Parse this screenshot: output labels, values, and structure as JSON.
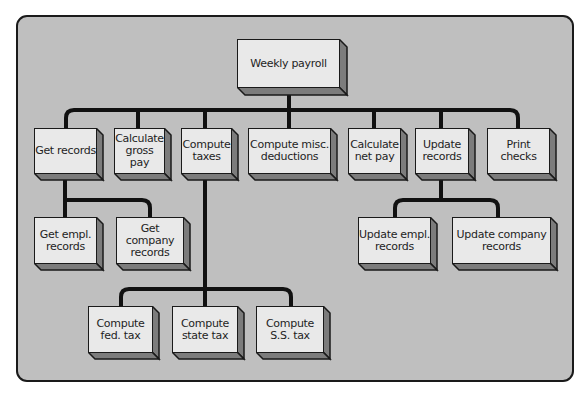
{
  "diagram": {
    "title": "Weekly payroll",
    "colors": {
      "background": "#bfbfbf",
      "box_face": "#e9e9e9",
      "box_side": "#7c7c7c",
      "line": "#111111"
    },
    "root": {
      "label": "Weekly payroll"
    },
    "level2": [
      {
        "label": "Get records"
      },
      {
        "label": "Calculate\ngross pay"
      },
      {
        "label": "Compute\ntaxes"
      },
      {
        "label": "Compute misc.\ndeductions"
      },
      {
        "label": "Calculate\nnet pay"
      },
      {
        "label": "Update\nrecords"
      },
      {
        "label": "Print\nchecks"
      }
    ],
    "get_records_children": [
      {
        "label": "Get empl.\nrecords"
      },
      {
        "label": "Get company\nrecords"
      }
    ],
    "update_records_children": [
      {
        "label": "Update empl.\nrecords"
      },
      {
        "label": "Update company\nrecords"
      }
    ],
    "compute_taxes_children": [
      {
        "label": "Compute\nfed. tax"
      },
      {
        "label": "Compute\nstate tax"
      },
      {
        "label": "Compute\nS.S. tax"
      }
    ]
  }
}
